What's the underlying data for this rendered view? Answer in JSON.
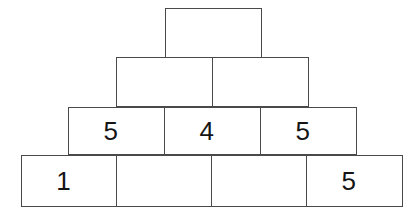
{
  "figure": {
    "name": "number-pyramid",
    "background_color": "#ffffff",
    "border_color": "#4a4a4a",
    "text_color": "#151515"
  },
  "pyramid": {
    "row_count": 4,
    "rows": [
      {
        "index": 1,
        "name": "row-top",
        "cell_count": 1,
        "cells": [
          {
            "index": 0,
            "value": "",
            "filled": false
          }
        ]
      },
      {
        "index": 2,
        "name": "row-second",
        "cell_count": 2,
        "cells": [
          {
            "index": 0,
            "value": "",
            "filled": false
          },
          {
            "index": 1,
            "value": "",
            "filled": false
          }
        ]
      },
      {
        "index": 3,
        "name": "row-third",
        "cell_count": 3,
        "cells": [
          {
            "index": 0,
            "value": "5",
            "filled": true
          },
          {
            "index": 1,
            "value": "4",
            "filled": true
          },
          {
            "index": 2,
            "value": "5",
            "filled": true
          }
        ]
      },
      {
        "index": 4,
        "name": "row-base",
        "cell_count": 4,
        "cells": [
          {
            "index": 0,
            "value": "1",
            "filled": true
          },
          {
            "index": 1,
            "value": "",
            "filled": false
          },
          {
            "index": 2,
            "value": "",
            "filled": false
          },
          {
            "index": 3,
            "value": "5",
            "filled": true
          }
        ]
      }
    ]
  }
}
